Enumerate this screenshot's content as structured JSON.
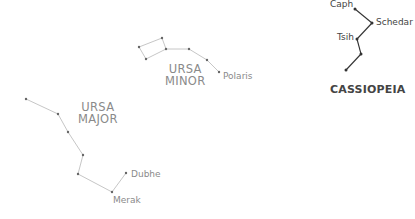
{
  "colors": {
    "faded": "#8a8a8a",
    "faded_line": "#b8b8b8",
    "bold": "#444444",
    "bold_line": "#333333"
  },
  "constellations": [
    {
      "name_line1": "URSA",
      "name_line2": "MINOR",
      "style": "faded",
      "stars": [
        [
          139,
          47
        ],
        [
          162,
          38
        ],
        [
          166,
          49
        ],
        [
          146,
          59
        ],
        [
          189,
          49
        ],
        [
          207,
          60
        ],
        [
          219,
          72
        ]
      ],
      "edges": [
        [
          0,
          1
        ],
        [
          1,
          2
        ],
        [
          2,
          3
        ],
        [
          3,
          0
        ],
        [
          2,
          4
        ],
        [
          4,
          5
        ],
        [
          5,
          6
        ]
      ],
      "labels": [
        {
          "text": "Polaris",
          "star": 6
        }
      ]
    },
    {
      "name_line1": "URSA",
      "name_line2": "MAJOR",
      "style": "faded",
      "stars": [
        [
          26,
          99
        ],
        [
          58,
          114
        ],
        [
          68,
          132
        ],
        [
          83,
          155
        ],
        [
          78,
          174
        ],
        [
          112,
          192
        ],
        [
          126,
          173
        ]
      ],
      "edges": [
        [
          0,
          1
        ],
        [
          1,
          2
        ],
        [
          2,
          3
        ],
        [
          3,
          4
        ],
        [
          4,
          5
        ],
        [
          5,
          6
        ]
      ],
      "labels": [
        {
          "text": "Dubhe",
          "star": 6
        },
        {
          "text": "Merak",
          "star": 5
        }
      ]
    },
    {
      "name": "CASSIOPEIA",
      "style": "bold",
      "stars": [
        [
          355,
          9
        ],
        [
          372,
          23
        ],
        [
          357,
          39
        ],
        [
          361,
          54
        ],
        [
          346,
          70
        ]
      ],
      "edges": [
        [
          0,
          1
        ],
        [
          1,
          2
        ],
        [
          2,
          3
        ],
        [
          3,
          4
        ]
      ],
      "labels": [
        {
          "text": "Caph",
          "star": 0
        },
        {
          "text": "Schedar",
          "star": 1
        },
        {
          "text": "Tsih",
          "star": 2
        }
      ]
    }
  ]
}
